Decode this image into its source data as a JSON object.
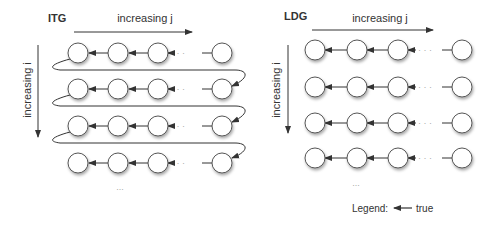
{
  "panels": [
    {
      "title": "ITG",
      "horizontal_axis_label": "increasing j",
      "vertical_axis_label": "increasing i",
      "rows": 4,
      "columns_shown": [
        "j1",
        "j2",
        "j3",
        "...",
        "jn"
      ],
      "row_wraparound": true,
      "continuation": "..."
    },
    {
      "title": "LDG",
      "horizontal_axis_label": "increasing j",
      "vertical_axis_label": "increasing i",
      "rows": 4,
      "columns_shown": [
        "j1",
        "j2",
        "j3",
        "...",
        "jn"
      ],
      "row_wraparound": false,
      "continuation": "..."
    }
  ],
  "legend": {
    "label": "Legend:",
    "entries": [
      {
        "symbol": "left-arrow",
        "text": "true"
      }
    ]
  },
  "colors": {
    "node_fill": "#ffffff",
    "node_stroke": "#555555",
    "edge": "#333333"
  }
}
